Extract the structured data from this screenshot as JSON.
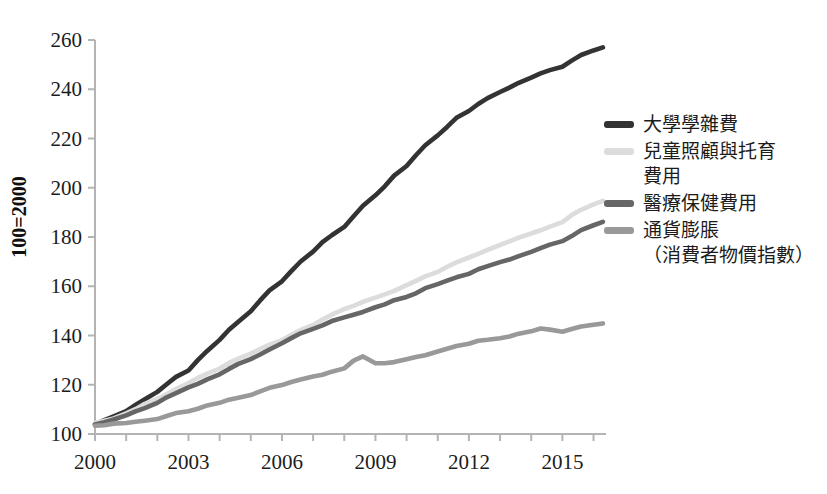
{
  "chart_data": {
    "type": "line",
    "title": "",
    "xlabel": "",
    "ylabel": "100=2000",
    "xlim": [
      2000,
      2016.4
    ],
    "ylim": [
      100,
      260
    ],
    "grid": false,
    "legend_position": "right",
    "xticks": [
      "2000",
      "2003",
      "2006",
      "2009",
      "2012",
      "2015"
    ],
    "xtick_values": [
      2000,
      2003,
      2006,
      2009,
      2012,
      2015
    ],
    "minor_xtick_values": [
      2000,
      2001,
      2002,
      2003,
      2004,
      2005,
      2006,
      2007,
      2008,
      2009,
      2010,
      2011,
      2012,
      2013,
      2014,
      2015,
      2016
    ],
    "yticks": [
      "100",
      "120",
      "140",
      "160",
      "180",
      "200",
      "220",
      "240",
      "260"
    ],
    "ytick_values": [
      100,
      120,
      140,
      160,
      180,
      200,
      220,
      240,
      260
    ],
    "x": [
      2000,
      2000.3,
      2000.6,
      2001,
      2001.3,
      2001.6,
      2002,
      2002.3,
      2002.6,
      2003,
      2003.3,
      2003.6,
      2004,
      2004.3,
      2004.6,
      2005,
      2005.3,
      2005.6,
      2006,
      2006.3,
      2006.6,
      2007,
      2007.3,
      2007.6,
      2008,
      2008.3,
      2008.6,
      2009,
      2009.3,
      2009.6,
      2010,
      2010.3,
      2010.6,
      2011,
      2011.3,
      2011.6,
      2012,
      2012.3,
      2012.6,
      2013,
      2013.3,
      2013.6,
      2014,
      2014.3,
      2014.6,
      2015,
      2015.3,
      2015.6,
      2016,
      2016.3
    ],
    "series": [
      {
        "name": "大學學雜費",
        "color": "#333333",
        "values": [
          104,
          105.5,
          107,
          109,
          111.5,
          114,
          117,
          120,
          123,
          126,
          130,
          134,
          138.5,
          142.5,
          146,
          150,
          154,
          158,
          162,
          166,
          170,
          174,
          177.5,
          181,
          184.5,
          188.5,
          193,
          197,
          201,
          205,
          209,
          213,
          217,
          221,
          224.5,
          228,
          231,
          234,
          236.5,
          239,
          241,
          243,
          245,
          246.5,
          248,
          249.5,
          251.5,
          253.5,
          255.5,
          257
        ]
      },
      {
        "name": "兒童照顧與托育\n費用",
        "color": "#dcdcdc",
        "values": [
          104,
          105,
          106.5,
          108.5,
          110.5,
          112.5,
          114.5,
          116.5,
          118.5,
          120.5,
          122.5,
          124.5,
          126.5,
          128.5,
          130.5,
          132.5,
          134.5,
          136.5,
          138.5,
          140.5,
          142.5,
          144.5,
          146.5,
          148.5,
          150.5,
          152,
          153.5,
          155,
          156.5,
          158,
          160,
          162,
          164,
          166,
          168,
          170,
          172,
          173.5,
          175,
          176.5,
          178,
          179.5,
          181,
          182.5,
          184,
          186,
          189,
          191.5,
          193.5,
          195
        ]
      },
      {
        "name": "醫療保健費用",
        "color": "#666666",
        "values": [
          104,
          105,
          106,
          107.5,
          109,
          110.5,
          112.5,
          114.5,
          116.5,
          118.5,
          120.5,
          122.5,
          124.5,
          126.5,
          128.5,
          130.5,
          132.5,
          134.5,
          136.5,
          138.5,
          140.5,
          142.5,
          144,
          145.5,
          147,
          148.5,
          150,
          151.5,
          153,
          154.5,
          156,
          157.5,
          159,
          160.5,
          162,
          163.5,
          165,
          166.5,
          168,
          169.5,
          171,
          172.5,
          174,
          175.5,
          177,
          178.5,
          180.5,
          182.5,
          184.5,
          186
        ]
      },
      {
        "name": "通貨膨脹\n（消費者物價指數）",
        "color": "#999999",
        "values": [
          103,
          103.5,
          104,
          104.5,
          105,
          105.5,
          106.5,
          107.5,
          108.5,
          109.5,
          110.5,
          111.5,
          112.5,
          113.5,
          114.5,
          115.5,
          117,
          118.5,
          120,
          121.5,
          122.5,
          123.5,
          124.5,
          125.5,
          127,
          130,
          131.5,
          128.5,
          128.5,
          129,
          130,
          131,
          132,
          133.5,
          135,
          136,
          137,
          138,
          138.5,
          139,
          139.5,
          140.5,
          141.5,
          142.5,
          142,
          141.5,
          142.5,
          143.5,
          144.5,
          145
        ]
      }
    ]
  },
  "legend": {
    "items": [
      {
        "label": "大學學雜費",
        "color": "#333333"
      },
      {
        "label": "兒童照顧與托育\n費用",
        "color": "#dcdcdc"
      },
      {
        "label": "醫療保健費用",
        "color": "#666666"
      },
      {
        "label": "通貨膨脹\n（消費者物價指數）",
        "color": "#999999"
      }
    ]
  },
  "axes": {
    "y_axis_title": "100=2000"
  }
}
